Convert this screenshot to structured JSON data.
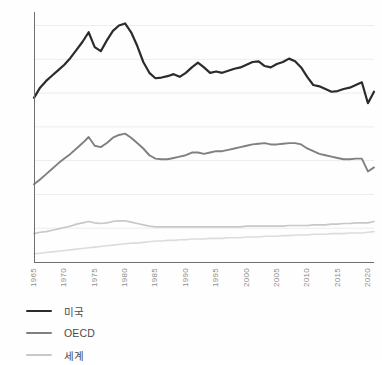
{
  "chart_data": {
    "type": "line",
    "title": "",
    "subtitle": "",
    "xlabel": "",
    "ylabel": "",
    "xlim": [
      1965,
      2021
    ],
    "ylim": [
      0,
      3.7
    ],
    "grid": true,
    "grid_axis": "y",
    "legend_position": "bottom-left",
    "x_tick_labels": [
      "1965",
      "1970",
      "1975",
      "1980",
      "1985",
      "1990",
      "1995",
      "2000",
      "2005",
      "2010",
      "2015",
      "2020"
    ],
    "x_ticks": [
      1965,
      1970,
      1975,
      1980,
      1985,
      1990,
      1995,
      2000,
      2005,
      2010,
      2015,
      2020
    ],
    "y_tick_labels": [
      "0",
      "0,5",
      "1,0",
      "1,5",
      "2,0",
      "2,5",
      "3,0",
      "3,5"
    ],
    "y_ticks": [
      0,
      0.5,
      1.0,
      1.5,
      2.0,
      2.5,
      3.0,
      3.5
    ],
    "decimal_separator": ",",
    "x": [
      1965,
      1966,
      1967,
      1968,
      1969,
      1970,
      1971,
      1972,
      1973,
      1974,
      1975,
      1976,
      1977,
      1978,
      1979,
      1980,
      1981,
      1982,
      1983,
      1984,
      1985,
      1986,
      1987,
      1988,
      1989,
      1990,
      1991,
      1992,
      1993,
      1994,
      1995,
      1996,
      1997,
      1998,
      1999,
      2000,
      2001,
      2002,
      2003,
      2004,
      2005,
      2006,
      2007,
      2008,
      2009,
      2010,
      2011,
      2012,
      2013,
      2014,
      2015,
      2016,
      2017,
      2018,
      2019,
      2020,
      2021
    ],
    "series": [
      {
        "name": "미국",
        "color": "#2b2b2b",
        "width": 2.2,
        "values": [
          2.43,
          2.58,
          2.68,
          2.76,
          2.84,
          2.92,
          3.02,
          3.14,
          3.26,
          3.4,
          3.18,
          3.12,
          3.28,
          3.42,
          3.5,
          3.53,
          3.4,
          3.2,
          2.96,
          2.8,
          2.72,
          2.73,
          2.75,
          2.78,
          2.74,
          2.8,
          2.88,
          2.95,
          2.88,
          2.8,
          2.82,
          2.8,
          2.83,
          2.86,
          2.88,
          2.92,
          2.96,
          2.97,
          2.9,
          2.88,
          2.93,
          2.96,
          3.01,
          2.97,
          2.88,
          2.74,
          2.62,
          2.6,
          2.56,
          2.52,
          2.53,
          2.56,
          2.58,
          2.62,
          2.66,
          2.35,
          2.52
        ]
      },
      {
        "name": "OECD",
        "color": "#808080",
        "width": 1.9,
        "values": [
          1.15,
          1.22,
          1.3,
          1.38,
          1.46,
          1.53,
          1.6,
          1.68,
          1.76,
          1.85,
          1.72,
          1.7,
          1.76,
          1.84,
          1.88,
          1.9,
          1.84,
          1.76,
          1.68,
          1.58,
          1.53,
          1.52,
          1.52,
          1.54,
          1.56,
          1.58,
          1.62,
          1.62,
          1.6,
          1.62,
          1.64,
          1.64,
          1.66,
          1.68,
          1.7,
          1.72,
          1.74,
          1.75,
          1.76,
          1.74,
          1.74,
          1.75,
          1.76,
          1.76,
          1.74,
          1.68,
          1.64,
          1.6,
          1.58,
          1.56,
          1.54,
          1.52,
          1.52,
          1.53,
          1.53,
          1.34,
          1.4
        ]
      },
      {
        "name": "세계",
        "color": "#c8c8c8",
        "width": 1.7,
        "values": [
          0.42,
          0.44,
          0.45,
          0.47,
          0.49,
          0.51,
          0.53,
          0.56,
          0.58,
          0.6,
          0.58,
          0.57,
          0.58,
          0.6,
          0.61,
          0.61,
          0.59,
          0.57,
          0.55,
          0.53,
          0.52,
          0.52,
          0.52,
          0.52,
          0.52,
          0.52,
          0.52,
          0.52,
          0.52,
          0.52,
          0.52,
          0.52,
          0.52,
          0.52,
          0.52,
          0.53,
          0.53,
          0.53,
          0.53,
          0.53,
          0.53,
          0.53,
          0.54,
          0.54,
          0.54,
          0.54,
          0.55,
          0.55,
          0.55,
          0.56,
          0.56,
          0.57,
          0.57,
          0.58,
          0.58,
          0.58,
          0.6
        ]
      },
      {
        "name": "세계-lower",
        "color": "#dcdcdc",
        "width": 1.6,
        "values": [
          0.12,
          0.13,
          0.14,
          0.15,
          0.16,
          0.17,
          0.18,
          0.19,
          0.2,
          0.21,
          0.22,
          0.23,
          0.24,
          0.25,
          0.26,
          0.27,
          0.28,
          0.28,
          0.29,
          0.3,
          0.31,
          0.31,
          0.32,
          0.32,
          0.33,
          0.33,
          0.34,
          0.34,
          0.34,
          0.35,
          0.35,
          0.35,
          0.36,
          0.36,
          0.36,
          0.37,
          0.37,
          0.37,
          0.38,
          0.38,
          0.38,
          0.39,
          0.39,
          0.4,
          0.4,
          0.4,
          0.41,
          0.41,
          0.41,
          0.42,
          0.42,
          0.42,
          0.43,
          0.43,
          0.43,
          0.44,
          0.45
        ]
      }
    ],
    "legend": [
      {
        "label": "미국",
        "color": "#2b2b2b"
      },
      {
        "label": "OECD",
        "color": "#808080"
      },
      {
        "label": "세계",
        "color": "#c8c8c8"
      }
    ]
  }
}
